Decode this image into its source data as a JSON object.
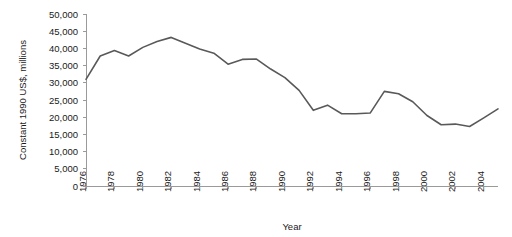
{
  "chart_data": {
    "type": "line",
    "title": "",
    "xlabel": "Year",
    "ylabel": "Constant 1990 US$, millions",
    "xlim": [
      1976,
      2005
    ],
    "ylim": [
      0,
      50000
    ],
    "ytick_step": 5000,
    "xtick_step": 2,
    "grid": false,
    "legend": "none",
    "line_color": "#595959",
    "axis_color": "#9a9a9a",
    "background_color": "#ffffff",
    "x": [
      1976,
      1977,
      1978,
      1979,
      1980,
      1981,
      1982,
      1983,
      1984,
      1985,
      1986,
      1987,
      1988,
      1989,
      1990,
      1991,
      1992,
      1993,
      1994,
      1995,
      1996,
      1997,
      1998,
      1999,
      2000,
      2001,
      2002,
      2003,
      2004,
      2005
    ],
    "values": [
      31000,
      37800,
      39400,
      37800,
      40300,
      42000,
      43200,
      41500,
      39800,
      38600,
      35400,
      36800,
      36900,
      34000,
      31500,
      27800,
      22000,
      23500,
      21000,
      21000,
      21200,
      27500,
      26800,
      24500,
      20500,
      17800,
      18000,
      17300,
      19800,
      22400
    ],
    "ytick_labels": [
      "0",
      "5,000",
      "10,000",
      "15,000",
      "20,000",
      "25,000",
      "30,000",
      "35,000",
      "40,000",
      "45,000",
      "50,000"
    ],
    "ytick_values": [
      0,
      5000,
      10000,
      15000,
      20000,
      25000,
      30000,
      35000,
      40000,
      45000,
      50000
    ],
    "xtick_labels": [
      "1976",
      "1978",
      "1980",
      "1982",
      "1984",
      "1986",
      "1988",
      "1990",
      "1992",
      "1994",
      "1996",
      "1998",
      "2000",
      "2002",
      "2004"
    ],
    "xtick_values": [
      1976,
      1978,
      1980,
      1982,
      1984,
      1986,
      1988,
      1990,
      1992,
      1994,
      1996,
      1998,
      2000,
      2002,
      2004
    ]
  }
}
